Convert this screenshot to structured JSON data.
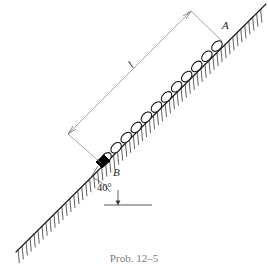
{
  "figure": {
    "caption": "Prob. 12–5",
    "labels": {
      "length": "l",
      "point_top": "A",
      "point_bottom": "B",
      "angle": "40°"
    },
    "colors": {
      "line": "#1a1a1a",
      "dimension_line": "#8a8a8a",
      "hatch": "#2b2b2b",
      "block": "#000000",
      "background": "#ffffff",
      "caption": "#7a7a7a"
    },
    "geometry": {
      "incline_angle_degrees": 40,
      "incline_start": [
        16,
        252
      ],
      "incline_end": [
        266,
        4
      ],
      "block_position": [
        101,
        163
      ],
      "chain_link_count": 12,
      "dimension_start": [
        68,
        134
      ],
      "dimension_end": [
        191,
        11
      ],
      "horizontal_reference_y": 205
    },
    "elements": {
      "incline_surface": "inclined-ground-line",
      "ground_hatching": "hatch-marks",
      "chain": "chain-of-links",
      "block": "block-at-b",
      "dimension": "length-dimension-line",
      "angle_indicator": "angle-arc-40-degrees"
    }
  }
}
